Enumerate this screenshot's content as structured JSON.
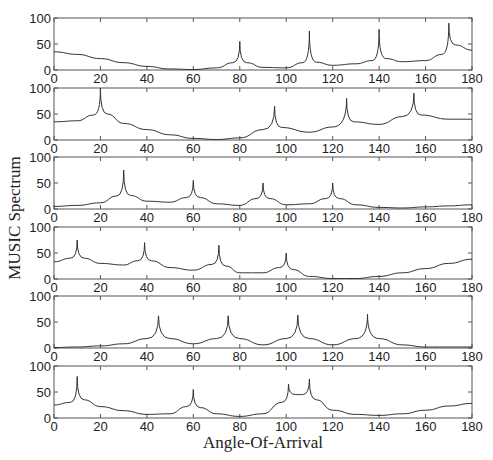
{
  "figure": {
    "xlabel": "Angle-Of-Arrival",
    "ylabel": "MUSIC Spectrum"
  },
  "chart_data": {
    "type": "line",
    "title": "",
    "xlabel": "Angle-Of-Arrival",
    "ylabel": "MUSIC Spectrum",
    "xlim": [
      0,
      180
    ],
    "ylim": [
      0,
      100
    ],
    "xticks": [
      0,
      20,
      40,
      60,
      80,
      100,
      120,
      140,
      160,
      180
    ],
    "yticks": [
      0,
      50,
      100
    ],
    "grid": false,
    "legend": null,
    "subplots": [
      {
        "name": "subplot-1",
        "x": [
          0,
          10,
          20,
          30,
          40,
          50,
          60,
          70,
          77,
          80,
          83,
          90,
          100,
          107,
          110,
          113,
          120,
          130,
          137,
          140,
          143,
          150,
          160,
          167,
          170,
          173,
          180
        ],
        "y": [
          35,
          30,
          22,
          14,
          7,
          2,
          1,
          4,
          14,
          55,
          14,
          5,
          4,
          14,
          75,
          15,
          9,
          12,
          18,
          78,
          22,
          16,
          18,
          30,
          90,
          48,
          38
        ],
        "peaks": [
          {
            "x": 80,
            "y": 55
          },
          {
            "x": 110,
            "y": 75
          },
          {
            "x": 140,
            "y": 78
          },
          {
            "x": 170,
            "y": 90
          }
        ]
      },
      {
        "name": "subplot-2",
        "x": [
          0,
          10,
          17,
          20,
          23,
          30,
          40,
          50,
          60,
          70,
          80,
          90,
          95,
          98,
          110,
          120,
          126,
          129,
          140,
          150,
          155,
          158,
          170,
          180
        ],
        "y": [
          35,
          37,
          48,
          100,
          50,
          32,
          20,
          10,
          3,
          1,
          4,
          20,
          65,
          24,
          15,
          25,
          80,
          35,
          30,
          45,
          90,
          48,
          40,
          40
        ],
        "peaks": [
          {
            "x": 20,
            "y": 100
          },
          {
            "x": 95,
            "y": 65
          },
          {
            "x": 126,
            "y": 80
          },
          {
            "x": 155,
            "y": 90
          }
        ]
      },
      {
        "name": "subplot-3",
        "x": [
          0,
          10,
          20,
          27,
          30,
          33,
          40,
          50,
          57,
          60,
          63,
          70,
          80,
          87,
          90,
          93,
          100,
          110,
          117,
          120,
          123,
          130,
          140,
          150,
          160,
          170,
          180
        ],
        "y": [
          5,
          7,
          12,
          25,
          75,
          26,
          15,
          13,
          22,
          55,
          22,
          10,
          7,
          20,
          50,
          20,
          8,
          10,
          20,
          50,
          20,
          8,
          3,
          2,
          4,
          6,
          8
        ],
        "peaks": [
          {
            "x": 30,
            "y": 75
          },
          {
            "x": 60,
            "y": 55
          },
          {
            "x": 90,
            "y": 50
          },
          {
            "x": 120,
            "y": 50
          }
        ]
      },
      {
        "name": "subplot-4",
        "x": [
          0,
          7,
          10,
          13,
          20,
          30,
          36,
          39,
          42,
          50,
          60,
          68,
          71,
          74,
          80,
          90,
          97,
          100,
          103,
          110,
          120,
          130,
          140,
          150,
          160,
          170,
          180
        ],
        "y": [
          33,
          40,
          75,
          40,
          30,
          27,
          35,
          70,
          35,
          22,
          17,
          28,
          65,
          25,
          12,
          12,
          22,
          50,
          18,
          5,
          1,
          1,
          5,
          12,
          20,
          30,
          38
        ],
        "peaks": [
          {
            "x": 10,
            "y": 75
          },
          {
            "x": 39,
            "y": 70
          },
          {
            "x": 71,
            "y": 65
          },
          {
            "x": 100,
            "y": 50
          }
        ]
      },
      {
        "name": "subplot-5",
        "x": [
          0,
          10,
          20,
          30,
          40,
          45,
          50,
          60,
          70,
          75,
          80,
          90,
          100,
          105,
          110,
          120,
          130,
          135,
          140,
          150,
          160,
          170,
          180
        ],
        "y": [
          1,
          2,
          4,
          8,
          18,
          62,
          18,
          8,
          18,
          62,
          18,
          6,
          18,
          63,
          18,
          6,
          18,
          65,
          18,
          6,
          2,
          2,
          2
        ],
        "peaks": [
          {
            "x": 45,
            "y": 62
          },
          {
            "x": 75,
            "y": 62
          },
          {
            "x": 105,
            "y": 63
          },
          {
            "x": 135,
            "y": 65
          }
        ]
      },
      {
        "name": "subplot-6",
        "x": [
          0,
          7,
          10,
          13,
          20,
          30,
          40,
          50,
          57,
          60,
          63,
          70,
          80,
          90,
          98,
          101,
          104,
          107,
          110,
          113,
          120,
          130,
          140,
          150,
          160,
          170,
          180
        ],
        "y": [
          25,
          30,
          80,
          35,
          22,
          14,
          7,
          8,
          22,
          55,
          20,
          8,
          3,
          8,
          30,
          65,
          45,
          45,
          75,
          35,
          15,
          7,
          5,
          8,
          15,
          23,
          28
        ],
        "peaks": [
          {
            "x": 10,
            "y": 80
          },
          {
            "x": 60,
            "y": 55
          },
          {
            "x": 101,
            "y": 65
          },
          {
            "x": 110,
            "y": 75
          }
        ]
      }
    ]
  }
}
